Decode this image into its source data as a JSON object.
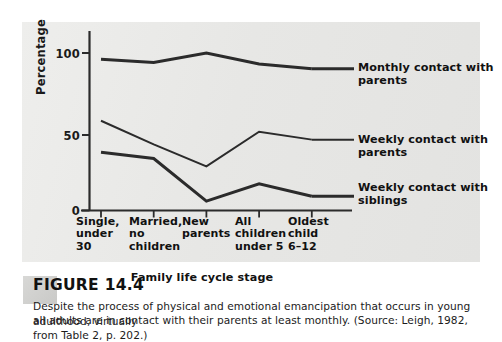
{
  "figure": {
    "number_label": "FIGURE 14.4",
    "caption_line1": "Despite the process of physical and emotional emancipation that occurs in young adulthood, virtually",
    "caption_line2": "all adults are in contact with their parents at least monthly. (Source: Leigh, 1982, from Table 2, p. 202.)"
  },
  "axis": {
    "y_label": "Percentage",
    "x_label": "Family life cycle stage",
    "y_ticks": [
      "0",
      "50",
      "100"
    ],
    "x_tick_labels": [
      "Single,\nunder 30",
      "Married,\nno\nchildren",
      "New\nparents",
      "All\nchildren\nunder 5",
      "Oldest\nchild\n6–12"
    ]
  },
  "series_labels": [
    "Monthly contact with\nparents",
    "Weekly contact with\nparents",
    "Weekly contact with\nsiblings"
  ],
  "colors": {
    "panel_background": "#e9e9e7",
    "page_background": "#ffffff",
    "line": "#2b2b2b",
    "axis": "#2b2b2b",
    "text": "#111111"
  },
  "chart_data": {
    "type": "line",
    "title": "",
    "xlabel": "Family life cycle stage",
    "ylabel": "Percentage",
    "ylim": [
      0,
      110
    ],
    "yticks": [
      0,
      50,
      100
    ],
    "grid": false,
    "legend_position": "right-of-line-ends",
    "categories": [
      "Single, under 30",
      "Married, no children",
      "New parents",
      "All children under 5",
      "Oldest child 6–12"
    ],
    "series": [
      {
        "name": "Monthly contact with parents",
        "values": [
          96,
          94,
          100,
          93,
          90
        ],
        "line_width": 3
      },
      {
        "name": "Weekly contact with parents",
        "values": [
          57,
          42,
          28,
          50,
          45
        ],
        "line_width": 2
      },
      {
        "name": "Weekly contact with siblings",
        "values": [
          37,
          33,
          6,
          17,
          9
        ],
        "line_width": 3
      }
    ]
  }
}
